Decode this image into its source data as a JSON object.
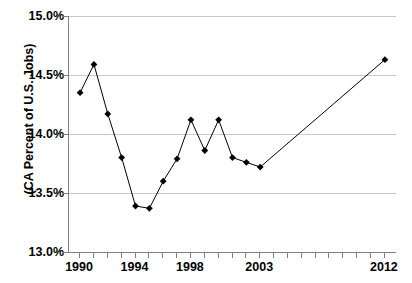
{
  "chart_data": {
    "type": "line",
    "title": "Professional and Business Services",
    "xlabel": "",
    "ylabel": "(CA Percent of U.S. Jobs)",
    "ylim": [
      13.0,
      15.0
    ],
    "ytick_labels": [
      "15.0%",
      "14.5%",
      "14.0%",
      "13.5%",
      "13.0%"
    ],
    "ytick_values": [
      15.0,
      14.5,
      14.0,
      13.5,
      13.0
    ],
    "xtick_labels": [
      "1990",
      "1994",
      "1998",
      "2003",
      "2012"
    ],
    "xtick_values": [
      1990,
      1994,
      1998,
      2003,
      2012
    ],
    "grid": true,
    "legend": "none",
    "marker": "diamond",
    "line_color": "#000000",
    "marker_color": "#000000",
    "grid_color": "#c9c9c9",
    "axis_color": "#808080",
    "x": [
      1990,
      1991,
      1992,
      1993,
      1994,
      1995,
      1996,
      1997,
      1998,
      1999,
      2000,
      2001,
      2002,
      2003,
      2012
    ],
    "values": [
      14.35,
      14.59,
      14.17,
      13.8,
      13.39,
      13.37,
      13.6,
      13.79,
      14.12,
      13.86,
      14.12,
      13.8,
      13.76,
      13.72,
      14.63
    ],
    "series": [
      {
        "name": "CA Percent of U.S. Jobs",
        "values": [
          14.35,
          14.59,
          14.17,
          13.8,
          13.39,
          13.37,
          13.6,
          13.79,
          14.12,
          13.86,
          14.12,
          13.8,
          13.76,
          13.72,
          14.63
        ]
      }
    ]
  },
  "axis": {
    "y_title": "(CA Percent of U.S. Jobs)"
  }
}
